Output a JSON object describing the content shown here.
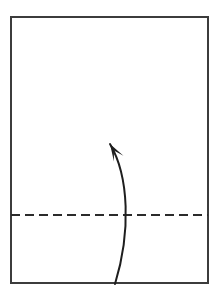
{
  "canvas": {
    "width": 220,
    "height": 297,
    "background_color": "#ffffff"
  },
  "diagram": {
    "type": "origami-fold-step",
    "title": "Valley fold: bring bottom edge up to horizontal crease"
  },
  "paper": {
    "name": "paper-sheet",
    "shape": "rectangle",
    "x": 11,
    "y": 17,
    "width": 197,
    "height": 266,
    "stroke_color": "#3c3c3c",
    "stroke_width": 2,
    "fill_color": "#ffffff"
  },
  "crease": {
    "name": "valley-fold-line",
    "style": "dashed",
    "orientation": "horizontal",
    "y": 215,
    "x_start": 11,
    "x_end": 208,
    "stroke_color": "#2b2b2b",
    "stroke_width": 2,
    "dash_length": 9,
    "gap_length": 5
  },
  "arrow": {
    "name": "fold-direction-arrow",
    "direction": "up",
    "stroke_color": "#1e1e1e",
    "stroke_width": 2,
    "tail_x": 115,
    "tail_y": 284,
    "tip_x": 110,
    "tip_y": 144,
    "control1_x": 131,
    "control1_y": 232,
    "control2_x": 129,
    "control2_y": 176,
    "head_length": 17,
    "head_width": 11,
    "path": "M 115 284 C 131 232 129 176 110 144"
  },
  "labels": {
    "paper_label": "",
    "crease_label": "",
    "arrow_label": ""
  }
}
